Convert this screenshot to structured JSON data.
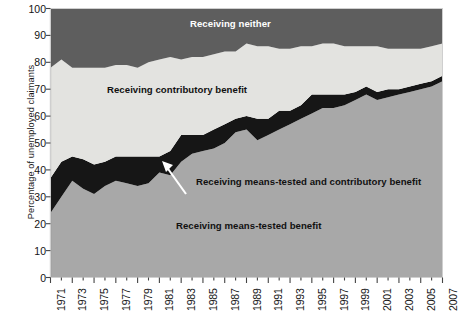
{
  "chart_data": {
    "type": "area",
    "title": "",
    "subtitle": "",
    "xlabel": "",
    "ylabel": "Percentage of unemployed claimants",
    "ylim": [
      0,
      100
    ],
    "xlim": [
      1971,
      2007
    ],
    "grid": false,
    "stacked": true,
    "legend_position": "inline-annotations",
    "ytick_labels": [
      "0",
      "10",
      "20",
      "30",
      "40",
      "50",
      "60",
      "70",
      "80",
      "90",
      "100"
    ],
    "ytick_values": [
      0,
      10,
      20,
      30,
      40,
      50,
      60,
      70,
      80,
      90,
      100
    ],
    "xtick_labels": [
      "1971",
      "1973",
      "1975",
      "1977",
      "1979",
      "1981",
      "1983",
      "1985",
      "1987",
      "1989",
      "1991",
      "1993",
      "1995",
      "1997",
      "1999",
      "2001",
      "2003",
      "2005",
      "2007"
    ],
    "xtick_values": [
      1971,
      1973,
      1975,
      1977,
      1979,
      1981,
      1983,
      1985,
      1987,
      1989,
      1991,
      1993,
      1995,
      1997,
      1999,
      2001,
      2003,
      2005,
      2007
    ],
    "x": [
      1971,
      1972,
      1973,
      1974,
      1975,
      1976,
      1977,
      1978,
      1979,
      1980,
      1981,
      1982,
      1983,
      1984,
      1985,
      1986,
      1987,
      1988,
      1989,
      1990,
      1991,
      1992,
      1993,
      1994,
      1995,
      1996,
      1997,
      1998,
      1999,
      2000,
      2001,
      2002,
      2003,
      2004,
      2005,
      2006,
      2007
    ],
    "series": [
      {
        "name": "Receiving means-tested benefit",
        "color": "#a8a8a8",
        "values": [
          24,
          30,
          36,
          33,
          31,
          34,
          36,
          35,
          34,
          35,
          39,
          38,
          43,
          46,
          47,
          48,
          50,
          54,
          55,
          51,
          53,
          55,
          57,
          59,
          61,
          63,
          63,
          64,
          66,
          68,
          66,
          67,
          68,
          69,
          70,
          71,
          73
        ]
      },
      {
        "name": "Receiving means-tested and contributory benefit",
        "color": "#161616",
        "values": [
          13,
          13,
          9,
          11,
          11,
          9,
          9,
          10,
          11,
          10,
          6,
          9,
          10,
          7,
          6,
          7,
          7,
          5,
          5,
          8,
          6,
          7,
          5,
          5,
          7,
          5,
          5,
          4,
          3,
          3,
          3,
          3,
          2,
          2,
          2,
          2,
          2
        ]
      },
      {
        "name": "Receiving contributory benefit",
        "color": "#e3e3e0",
        "values": [
          41,
          38,
          33,
          34,
          36,
          35,
          34,
          34,
          33,
          35,
          36,
          35,
          28,
          29,
          29,
          28,
          27,
          25,
          27,
          27,
          27,
          23,
          23,
          22,
          18,
          19,
          19,
          18,
          17,
          15,
          17,
          15,
          15,
          14,
          13,
          13,
          12
        ]
      },
      {
        "name": "Receiving neither",
        "color": "#5e5e5e",
        "values": [
          22,
          19,
          22,
          22,
          22,
          22,
          21,
          21,
          22,
          20,
          19,
          18,
          19,
          18,
          18,
          17,
          16,
          16,
          13,
          14,
          14,
          15,
          15,
          14,
          14,
          13,
          13,
          14,
          14,
          14,
          14,
          15,
          15,
          15,
          15,
          14,
          13
        ]
      }
    ],
    "annotations": [
      {
        "id": "neither",
        "text": "Receiving neither",
        "color": "#ffffff"
      },
      {
        "id": "contributory",
        "text": "Receiving contributory benefit",
        "color": "#111111"
      },
      {
        "id": "means_tested_and_contributory",
        "text": "Receiving means-tested and contributory benefit",
        "color": "#111111"
      },
      {
        "id": "means_tested",
        "text": "Receiving means-tested benefit",
        "color": "#111111"
      }
    ]
  },
  "axes": {
    "y_title": "Percentage of unemployed claimants"
  },
  "footer": {
    "cropped_note": ""
  }
}
